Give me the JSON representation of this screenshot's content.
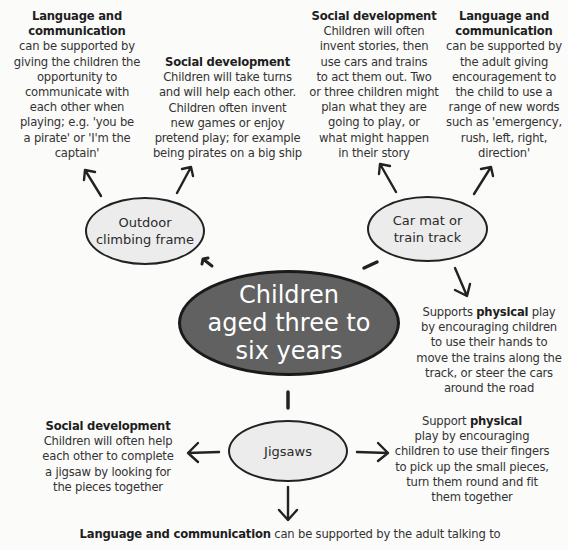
{
  "diagram": {
    "central": {
      "label_lines": [
        "Children",
        "aged three to",
        "six years"
      ]
    },
    "nodes": [
      {
        "id": "outdoor",
        "label_lines": [
          "Outdoor",
          "climbing frame"
        ]
      },
      {
        "id": "carmat",
        "label_lines": [
          "Car mat or",
          "train track"
        ]
      },
      {
        "id": "jigsaws",
        "label_lines": [
          "Jigsaws"
        ]
      }
    ],
    "notes": {
      "outdoor_language": {
        "heading": "Language and communication",
        "lines": [
          "can be supported by",
          "giving the children the",
          "opportunity to",
          "communicate with",
          "each other when",
          "playing; e.g. 'you be",
          "a pirate' or 'I'm the",
          "captain'"
        ]
      },
      "outdoor_social": {
        "heading": "Social development",
        "lines": [
          "Children will take turns",
          "and will help each other.",
          "Children often invent",
          "new games or enjoy",
          "pretend play; for example",
          "being pirates on a big ship"
        ]
      },
      "carmat_social": {
        "heading": "Social development",
        "lines": [
          "Children will often",
          "invent stories, then",
          "use cars and trains",
          "to act them out. Two",
          "or three children might",
          "plan what they are",
          "going to play, or",
          "what might happen",
          "in their story"
        ]
      },
      "carmat_language": {
        "heading": "Language and communication",
        "lines": [
          "can be supported by",
          "the adult giving",
          "encouragement to",
          "the child to use a",
          "range of new words",
          "such as 'emergency,",
          "rush, left, right,",
          "direction'"
        ]
      },
      "carmat_physical": {
        "prefix": "Supports ",
        "bold": "physical",
        "suffix": " play",
        "lines": [
          "by encouraging children",
          "to use their hands to",
          "move the trains along the",
          "track, or steer the cars",
          "around the road"
        ]
      },
      "jigsaw_social": {
        "heading": "Social development",
        "lines": [
          "Children will often help",
          "each other to complete",
          "a jigsaw by looking for",
          "the pieces together"
        ]
      },
      "jigsaw_physical": {
        "prefix": "Support ",
        "bold": "physical",
        "lines": [
          "play by encouraging",
          "children to use their fingers",
          "to pick up the small pieces,",
          "turn them round and fit",
          "them together"
        ]
      },
      "jigsaw_language": {
        "bold": "Language and communication",
        "suffix": " can be supported by the adult talking to"
      }
    }
  }
}
